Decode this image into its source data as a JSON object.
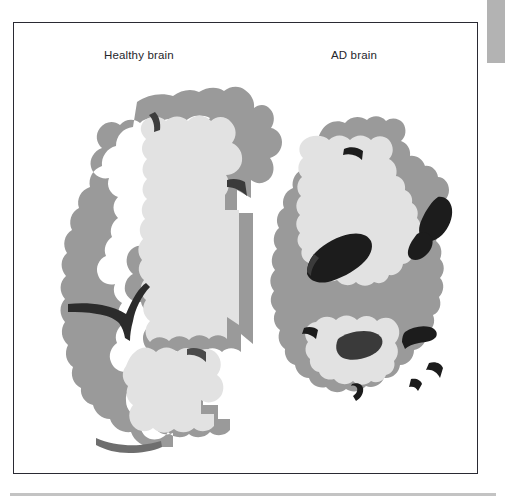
{
  "figure": {
    "panels": [
      {
        "id": "healthy",
        "label": "Healthy brain"
      },
      {
        "id": "ad",
        "label": "AD brain"
      }
    ]
  },
  "colors": {
    "page_background": "#ffffff",
    "frame_border": "#2a2a33",
    "corner_tab": "#b3b3b3",
    "bottom_rule": "#c3c3c3",
    "cortex_gray_matter": "#9a9a9a",
    "white_matter": "#e2e2e2",
    "ventricle_dark": "#1c1c1c",
    "sulcus_mid_dark": "#4a4a4a",
    "label_text": "#26262b"
  },
  "illustration": {
    "type": "coronal-brain-section-comparison",
    "healthy_brain": {
      "name": "healthy-brain-section",
      "features": [
        "thick cortical ribbon",
        "broad gyri",
        "narrow sulci",
        "small slit-like ventricle"
      ]
    },
    "ad_brain": {
      "name": "ad-brain-section",
      "features": [
        "thinned cortical ribbon",
        "atrophied gyri",
        "widened sulci",
        "enlarged dark ventricles",
        "shrunken hippocampus region"
      ]
    }
  }
}
